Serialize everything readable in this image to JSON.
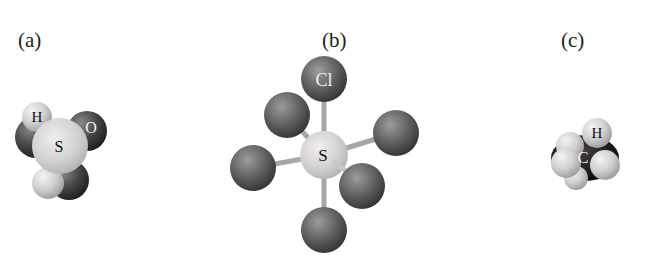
{
  "figure": {
    "panels": [
      {
        "id": "a",
        "label": "(a)",
        "model": "space-filling",
        "atoms": [
          {
            "symbol": "H",
            "shade": "light"
          },
          {
            "symbol": "S",
            "shade": "light"
          },
          {
            "symbol": "O",
            "shade": "dark"
          }
        ]
      },
      {
        "id": "b",
        "label": "(b)",
        "model": "ball-and-stick",
        "atoms": [
          {
            "symbol": "Cl",
            "shade": "dark"
          },
          {
            "symbol": "S",
            "shade": "light"
          }
        ]
      },
      {
        "id": "c",
        "label": "(c)",
        "model": "space-filling",
        "atoms": [
          {
            "symbol": "H",
            "shade": "light"
          },
          {
            "symbol": "C",
            "shade": "dark"
          }
        ]
      }
    ]
  },
  "colors": {
    "background": "#ffffff",
    "text": "#222222",
    "light_atom": "#d4d4d4",
    "dark_atom": "#3a3a3a",
    "bond": "#a8a8a8"
  }
}
